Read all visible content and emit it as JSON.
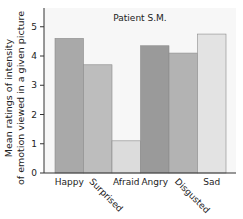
{
  "chart_data": {
    "type": "bar",
    "title": "Patient S.M.",
    "xlabel": "",
    "ylabel_lines": [
      "Mean ratings of intensity",
      "of emotion viewed in a given picture"
    ],
    "ylabel": "Mean ratings of intensity of emotion viewed in a given picture",
    "categories": [
      "Happy",
      "Surprised",
      "Afraid",
      "Angry",
      "Disgusted",
      "Sad"
    ],
    "values": [
      4.6,
      3.7,
      1.1,
      4.35,
      4.1,
      4.75
    ],
    "colors": [
      "#a9a9a9",
      "#bdbdbd",
      "#dcdcdc",
      "#9a9a9a",
      "#b3b3b3",
      "#e3e3e3"
    ],
    "rotated_labels": [
      false,
      true,
      false,
      false,
      true,
      false
    ],
    "ylim": [
      0,
      5.6
    ],
    "yticks": [
      0,
      1,
      2,
      3,
      4,
      5
    ],
    "grid": false,
    "legend": "none"
  }
}
